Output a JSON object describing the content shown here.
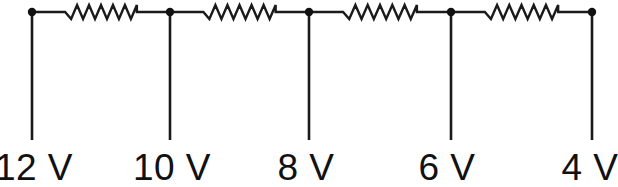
{
  "figure": {
    "type": "circuit-diagram",
    "background_color": "#ffffff",
    "line_color": "#1a1a1a",
    "text_color": "#111111"
  },
  "nodes": [
    {
      "id": "node-1",
      "label": "12 V",
      "voltage": 12,
      "unit": "V",
      "x": 32,
      "label_x": 34,
      "label_anchor": "middle"
    },
    {
      "id": "node-2",
      "label": "10 V",
      "voltage": 10,
      "unit": "V",
      "x": 170,
      "label_x": 172,
      "label_anchor": "middle"
    },
    {
      "id": "node-3",
      "label": "8 V",
      "voltage": 8,
      "unit": "V",
      "x": 309,
      "label_x": 306,
      "label_anchor": "middle"
    },
    {
      "id": "node-4",
      "label": "6 V",
      "voltage": 6,
      "unit": "V",
      "x": 451,
      "label_x": 447,
      "label_anchor": "middle"
    },
    {
      "id": "node-5",
      "label": "4 V",
      "voltage": 4,
      "unit": "V",
      "x": 592,
      "label_x": 590,
      "label_anchor": "middle"
    }
  ],
  "resistors": [
    {
      "id": "resistor-1",
      "between": [
        "node-1",
        "node-2"
      ],
      "x_start": 32,
      "x_end": 170,
      "voltage_drop": 2
    },
    {
      "id": "resistor-2",
      "between": [
        "node-2",
        "node-3"
      ],
      "x_start": 170,
      "x_end": 309,
      "voltage_drop": 2
    },
    {
      "id": "resistor-3",
      "between": [
        "node-3",
        "node-4"
      ],
      "x_start": 309,
      "x_end": 451,
      "voltage_drop": 2
    },
    {
      "id": "resistor-4",
      "between": [
        "node-4",
        "node-5"
      ],
      "x_start": 451,
      "x_end": 592,
      "voltage_drop": 2
    }
  ],
  "geometry": {
    "wire_y": 12,
    "lead_bottom_y": 140,
    "label_baseline_y": 180,
    "node_dot_radius": 4.2,
    "zigzag_amplitude": 7,
    "zigzag_peaks": 6,
    "zigzag_inset_fraction": 0.24
  }
}
